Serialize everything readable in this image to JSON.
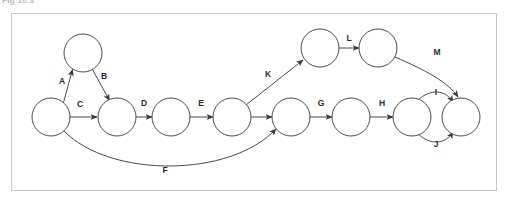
{
  "caption": {
    "text": "Fig 10.3"
  },
  "figure": {
    "border_color": "#c8c8c8",
    "background_color": "#ffffff",
    "node_stroke_color": "#4a4a4a",
    "label_color": "#2b2b2b"
  },
  "graph": {
    "type": "directed-graph",
    "node_radius": 19,
    "nodes": [
      {
        "id": "n1",
        "cx": 51,
        "cy": 117
      },
      {
        "id": "n2",
        "cx": 83,
        "cy": 53
      },
      {
        "id": "n3",
        "cx": 117,
        "cy": 117
      },
      {
        "id": "n4",
        "cx": 171,
        "cy": 117
      },
      {
        "id": "n5",
        "cx": 232,
        "cy": 117
      },
      {
        "id": "n6",
        "cx": 291,
        "cy": 117
      },
      {
        "id": "n7",
        "cx": 351,
        "cy": 117
      },
      {
        "id": "n8",
        "cx": 412,
        "cy": 117
      },
      {
        "id": "n9",
        "cx": 461,
        "cy": 117
      },
      {
        "id": "n10",
        "cx": 320,
        "cy": 48
      },
      {
        "id": "n11",
        "cx": 378,
        "cy": 48
      }
    ],
    "edges": [
      {
        "label": "A",
        "from": "n1",
        "to": "n2",
        "label_x": 62,
        "label_y": 82,
        "shape": "straight"
      },
      {
        "label": "B",
        "from": "n2",
        "to": "n3",
        "label_x": 104,
        "label_y": 77,
        "shape": "straight"
      },
      {
        "label": "C",
        "from": "n1",
        "to": "n3",
        "label_x": 80,
        "label_y": 105,
        "shape": "straight"
      },
      {
        "label": "D",
        "from": "n3",
        "to": "n4",
        "label_x": 144,
        "label_y": 104,
        "shape": "straight"
      },
      {
        "label": "E",
        "from": "n4",
        "to": "n5",
        "label_x": 201,
        "label_y": 104,
        "shape": "straight"
      },
      {
        "label": "",
        "from": "n5",
        "to": "n6",
        "label_x": 262,
        "label_y": 104,
        "shape": "straight"
      },
      {
        "label": "F",
        "from": "n1",
        "to": "n6",
        "label_x": 165,
        "label_y": 171,
        "shape": "curve-down"
      },
      {
        "label": "G",
        "from": "n6",
        "to": "n7",
        "label_x": 321,
        "label_y": 104,
        "shape": "straight"
      },
      {
        "label": "H",
        "from": "n7",
        "to": "n8",
        "label_x": 382,
        "label_y": 104,
        "shape": "straight"
      },
      {
        "label": "I",
        "from": "n8",
        "to": "n9",
        "label_x": 436,
        "label_y": 93,
        "shape": "curve-up"
      },
      {
        "label": "J",
        "from": "n8",
        "to": "n9",
        "label_x": 436,
        "label_y": 145,
        "shape": "curve-down"
      },
      {
        "label": "K",
        "from": "n5",
        "to": "n10",
        "label_x": 268,
        "label_y": 75,
        "shape": "straight"
      },
      {
        "label": "L",
        "from": "n10",
        "to": "n11",
        "label_x": 349,
        "label_y": 39,
        "shape": "straight"
      },
      {
        "label": "M",
        "from": "n11",
        "to": "n9",
        "label_x": 437,
        "label_y": 53,
        "shape": "curve-down"
      }
    ]
  }
}
